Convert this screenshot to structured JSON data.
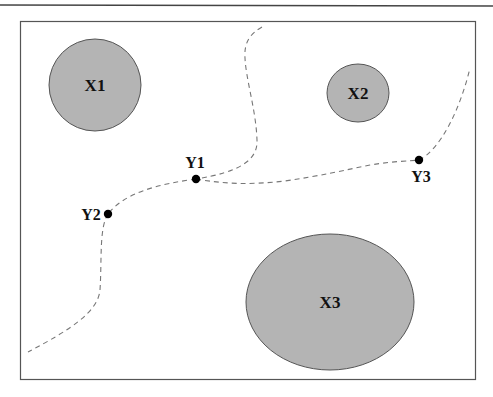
{
  "diagram": {
    "colors": {
      "background": "#ffffff",
      "frame": "#555555",
      "top_rule": "#444444",
      "region_fill": "#b4b4b4",
      "region_stroke": "#555555",
      "path_stroke": "#777777",
      "point_fill": "#000000",
      "text": "#111111"
    },
    "regions": [
      {
        "id": "X1",
        "label": "X1",
        "cx": 95,
        "cy": 85,
        "rx": 46,
        "ry": 46
      },
      {
        "id": "X2",
        "label": "X2",
        "cx": 358,
        "cy": 93,
        "rx": 31,
        "ry": 29
      },
      {
        "id": "X3",
        "label": "X3",
        "cx": 330,
        "cy": 302,
        "rx": 84,
        "ry": 68
      }
    ],
    "points": [
      {
        "id": "Y1",
        "label": "Y1",
        "x": 196,
        "y": 179
      },
      {
        "id": "Y2",
        "label": "Y2",
        "x": 108,
        "y": 214
      },
      {
        "id": "Y3",
        "label": "Y3",
        "x": 419,
        "y": 160
      }
    ],
    "paths": [
      {
        "id": "path-top-to-y1",
        "from": "top edge",
        "to": "Y1"
      },
      {
        "id": "path-y1-to-y2",
        "from": "Y1",
        "to": "Y2"
      },
      {
        "id": "path-y2-to-bottom-left",
        "from": "Y2",
        "to": "bottom-left"
      },
      {
        "id": "path-y1-to-y3",
        "from": "Y1",
        "to": "Y3"
      },
      {
        "id": "path-y3-to-right",
        "from": "Y3",
        "to": "top-right"
      }
    ]
  }
}
